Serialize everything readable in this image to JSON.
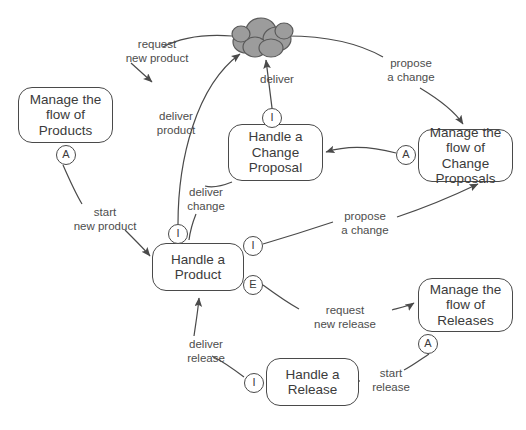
{
  "diagram": {
    "stroke_color": "#4a4a4a",
    "text_color": "#3b3b3b",
    "label_color": "#4d4d4d",
    "cloud_fill": "#9c9c9c",
    "background": "#ffffff"
  },
  "nodes": [
    {
      "id": "manage-products",
      "label": "Manage the\nflow of\nProducts",
      "x": 18,
      "y": 87,
      "w": 95,
      "h": 56
    },
    {
      "id": "handle-change-proposal",
      "label": "Handle a\nChange\nProposal",
      "x": 228,
      "y": 124,
      "w": 95,
      "h": 57
    },
    {
      "id": "manage-change-proposals",
      "label": "Manage the\nflow of Change\nProposals",
      "x": 418,
      "y": 129,
      "w": 95,
      "h": 53
    },
    {
      "id": "handle-product",
      "label": "Handle a\nProduct",
      "x": 152,
      "y": 243,
      "w": 92,
      "h": 48
    },
    {
      "id": "manage-releases",
      "label": "Manage the\nflow of\nReleases",
      "x": 418,
      "y": 278,
      "w": 95,
      "h": 54
    },
    {
      "id": "handle-release",
      "label": "Handle a\nRelease",
      "x": 266,
      "y": 358,
      "w": 93,
      "h": 48
    }
  ],
  "ports": [
    {
      "id": "port-products-a",
      "letter": "A",
      "x": 56,
      "y": 145
    },
    {
      "id": "port-change-proposal-i",
      "letter": "I",
      "x": 262,
      "y": 108
    },
    {
      "id": "port-change-proposals-a",
      "letter": "A",
      "x": 396,
      "y": 145
    },
    {
      "id": "port-product-i-top",
      "letter": "I",
      "x": 168,
      "y": 224
    },
    {
      "id": "port-product-i-right",
      "letter": "I",
      "x": 243,
      "y": 236
    },
    {
      "id": "port-product-e-right",
      "letter": "E",
      "x": 243,
      "y": 275
    },
    {
      "id": "port-releases-a",
      "letter": "A",
      "x": 418,
      "y": 334
    },
    {
      "id": "port-release-i",
      "letter": "I",
      "x": 244,
      "y": 373
    }
  ],
  "edge_labels": [
    {
      "id": "label-request-new-product",
      "text": "request\nnew product",
      "x": 109,
      "y": 38,
      "w": 96
    },
    {
      "id": "label-deliver",
      "text": "deliver",
      "x": 247,
      "y": 73,
      "w": 60
    },
    {
      "id": "label-propose-change-top",
      "text": "propose\na change",
      "x": 380,
      "y": 57,
      "w": 62
    },
    {
      "id": "label-deliver-product",
      "text": "deliver\nproduct",
      "x": 145,
      "y": 110,
      "w": 62
    },
    {
      "id": "label-deliver-change",
      "text": "deliver\nchange",
      "x": 175,
      "y": 186,
      "w": 62
    },
    {
      "id": "label-start-new-product",
      "text": "start\nnew product",
      "x": 62,
      "y": 206,
      "w": 86
    },
    {
      "id": "label-propose-change-low",
      "text": "propose\na change",
      "x": 334,
      "y": 210,
      "w": 62
    },
    {
      "id": "label-request-new-release",
      "text": "request\nnew release",
      "x": 300,
      "y": 304,
      "w": 90
    },
    {
      "id": "label-deliver-release",
      "text": "deliver\nrelease",
      "x": 175,
      "y": 338,
      "w": 62
    },
    {
      "id": "label-start-release",
      "text": "start\nrelease",
      "x": 362,
      "y": 367,
      "w": 58
    }
  ],
  "cloud": {
    "id": "cloud-stakeholders",
    "x": 228,
    "y": 12,
    "w": 60,
    "h": 42
  }
}
